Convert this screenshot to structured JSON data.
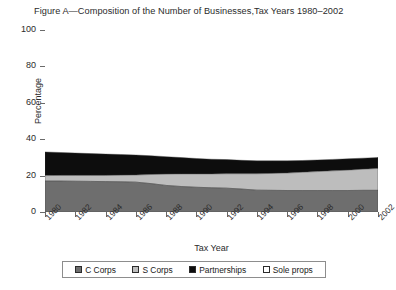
{
  "chart_data": {
    "type": "area",
    "title": "Figure A—Composition of the Number of Businesses,Tax Years 1980–2002",
    "xlabel": "Tax Year",
    "ylabel": "Percentage",
    "ylim": [
      0,
      100
    ],
    "yticks": [
      0,
      20,
      40,
      60,
      80,
      100
    ],
    "xlim": [
      1980,
      2002
    ],
    "xticks": [
      1980,
      1982,
      1984,
      1986,
      1988,
      1990,
      1992,
      1994,
      1996,
      1998,
      2000,
      2002
    ],
    "grid": false,
    "legend_position": "bottom",
    "stacked": true,
    "x": [
      1980,
      1981,
      1982,
      1983,
      1984,
      1985,
      1986,
      1987,
      1988,
      1989,
      1990,
      1991,
      1992,
      1993,
      1994,
      1995,
      1996,
      1997,
      1998,
      1999,
      2000,
      2001,
      2002
    ],
    "series": [
      {
        "name": "C Corps",
        "color": "#6e6e6e",
        "values": [
          17.0,
          17.0,
          16.9,
          16.8,
          16.7,
          16.6,
          16.4,
          15.6,
          14.6,
          14.0,
          13.6,
          13.3,
          13.1,
          12.6,
          12.0,
          11.9,
          11.8,
          11.8,
          11.8,
          11.8,
          11.8,
          11.9,
          11.9
        ]
      },
      {
        "name": "S Corps",
        "color": "#bdbdbd",
        "values": [
          3.0,
          3.1,
          3.2,
          3.3,
          3.4,
          3.6,
          3.9,
          5.0,
          6.2,
          6.9,
          7.3,
          7.6,
          7.9,
          8.4,
          9.0,
          9.3,
          9.6,
          10.0,
          10.4,
          10.8,
          11.2,
          11.6,
          12.0
        ]
      },
      {
        "name": "Partnerships",
        "color": "#0d0d0d",
        "values": [
          13.0,
          12.6,
          12.3,
          12.0,
          11.7,
          11.4,
          11.0,
          10.3,
          9.6,
          9.0,
          8.5,
          8.1,
          7.8,
          7.4,
          7.1,
          6.9,
          6.7,
          6.5,
          6.4,
          6.3,
          6.2,
          6.1,
          6.0
        ]
      },
      {
        "name": "Sole props",
        "color": "#ffffff",
        "values": [
          67.0,
          67.3,
          67.6,
          67.9,
          68.2,
          68.4,
          68.7,
          69.1,
          69.6,
          70.1,
          70.6,
          71.0,
          71.2,
          71.6,
          71.9,
          71.9,
          71.9,
          71.7,
          71.4,
          71.1,
          70.8,
          70.4,
          70.1
        ]
      }
    ]
  },
  "legend": {
    "items": [
      {
        "label": "C Corps",
        "color": "#6e6e6e"
      },
      {
        "label": "S Corps",
        "color": "#bdbdbd"
      },
      {
        "label": "Partnerships",
        "color": "#0d0d0d"
      },
      {
        "label": "Sole props",
        "color": "#ffffff"
      }
    ]
  }
}
